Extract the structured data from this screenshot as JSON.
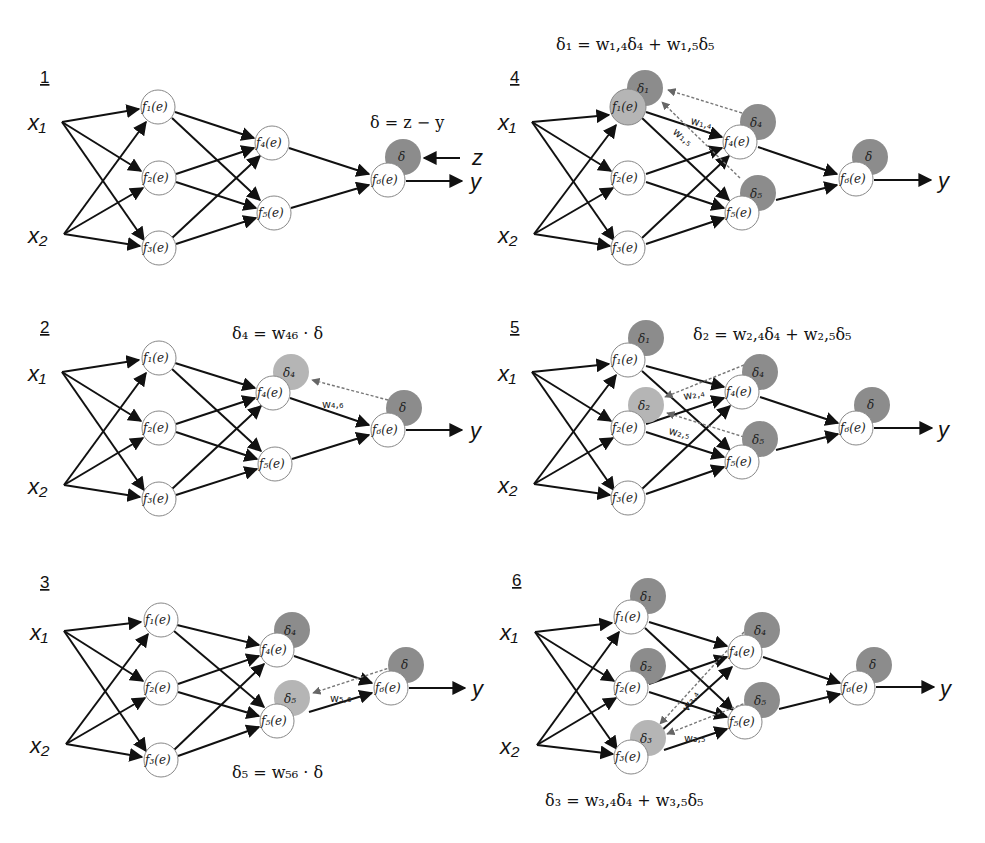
{
  "figure": {
    "colors": {
      "delta_dark": "#8c8c8c",
      "delta_light": "#b5b5b5",
      "edge": "#111111",
      "backprop_dashed": "#777777"
    },
    "inputs": [
      "x1",
      "x2"
    ],
    "neuron_labels": {
      "f1": "f₁(e)",
      "f2": "f₂(e)",
      "f3": "f₃(e)",
      "f4": "f₄(e)",
      "f5": "f₅(e)",
      "f6": "f₆(e)"
    },
    "output_label": "y",
    "target_label": "z"
  },
  "panels": [
    {
      "number": "1",
      "equation": "δ = z − y",
      "deltas": [
        "δ"
      ],
      "weights": []
    },
    {
      "number": "2",
      "equation": "δ₄ = w₄₆ · δ",
      "deltas": [
        "δ",
        "δ₄"
      ],
      "weights": [
        "w₄,₆"
      ]
    },
    {
      "number": "3",
      "equation": "δ₅ = w₅₆ · δ",
      "deltas": [
        "δ",
        "δ₄",
        "δ₅"
      ],
      "weights": [
        "w₅,₆"
      ]
    },
    {
      "number": "4",
      "equation": "δ₁ = w₁,₄δ₄ + w₁,₅δ₅",
      "deltas": [
        "δ",
        "δ₄",
        "δ₅",
        "δ₁"
      ],
      "weights": [
        "w₁,₄",
        "w₁,₅"
      ]
    },
    {
      "number": "5",
      "equation": "δ₂ = w₂,₄δ₄ + w₂,₅δ₅",
      "deltas": [
        "δ",
        "δ₄",
        "δ₅",
        "δ₁",
        "δ₂"
      ],
      "weights": [
        "w₂,₄",
        "w₂,₅"
      ]
    },
    {
      "number": "6",
      "equation": "δ₃ = w₃,₄δ₄ + w₃,₅δ₅",
      "deltas": [
        "δ",
        "δ₄",
        "δ₅",
        "δ₁",
        "δ₂",
        "δ₃"
      ],
      "weights": [
        "w₃,₄",
        "w₃,₅"
      ]
    }
  ],
  "labels": {
    "x1": "x₁",
    "x2": "x₂",
    "y": "y",
    "z": "z",
    "delta": "δ",
    "delta1": "δ₁",
    "delta2": "δ₂",
    "delta3": "δ₃",
    "delta4": "δ₄",
    "delta5": "δ₅"
  }
}
